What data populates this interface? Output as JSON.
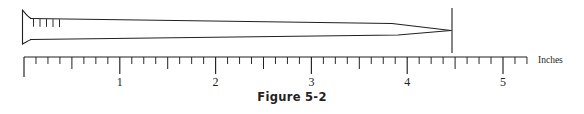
{
  "figure": {
    "caption": "Figure 5-2",
    "unit_label": "Inches",
    "line_color": "#231f20",
    "background": "#ffffff"
  },
  "ruler": {
    "origin_x": 24,
    "baseline_y": 57,
    "inch_spacing": 95.8,
    "end_x": 527,
    "major_tick_len": 17,
    "half_tick_len": 12,
    "eighth_tick_len": 7,
    "subdivisions_per_inch": 8,
    "tick_labels": [
      "1",
      "2",
      "3",
      "4",
      "5"
    ],
    "label_y": 86,
    "zero_tick_len": 20
  },
  "nail": {
    "name": "nail-object",
    "head_x": 22,
    "head_top_y": 10,
    "head_bottom_y": 44,
    "shank_top_y": 18.5,
    "shank_bottom_y": 39.5,
    "taper_start_x": 392,
    "tip_x": 451,
    "tip_y": 30.5,
    "measure_line_x": 452,
    "measure_line_top_y": 8,
    "measure_line_bottom_y": 53,
    "hatch_marks": {
      "count": 5,
      "start_x": 33,
      "spacing": 6.5,
      "top_y": 19,
      "length": 7
    },
    "measured_length_inches": "4.45"
  },
  "chart_data": {
    "type": "diagram",
    "title": "Figure 5-2",
    "xlabel": "Inches",
    "axis_range": [
      0,
      5.25
    ],
    "tick_values": [
      1,
      2,
      3,
      4,
      5
    ],
    "minor_tick_step": 0.125,
    "measured_value": 4.45
  }
}
